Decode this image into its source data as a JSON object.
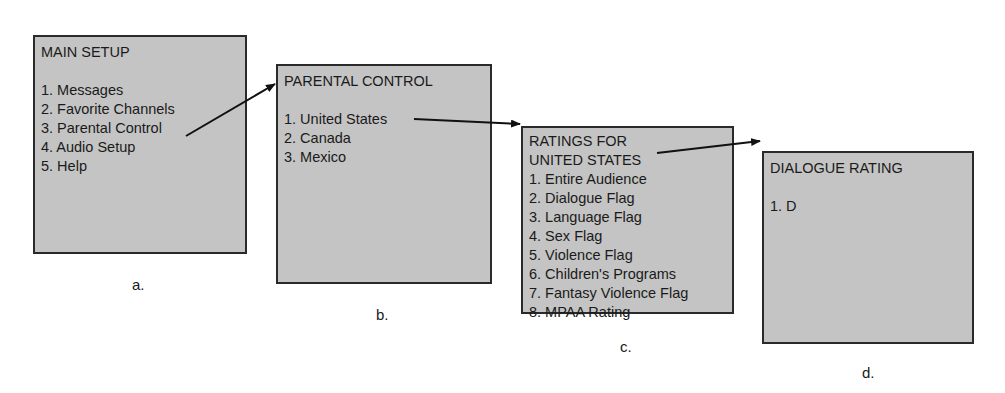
{
  "diagram": {
    "boxes": [
      {
        "id": "a",
        "title": "MAIN SETUP",
        "items": [
          "1. Messages",
          "2. Favorite Channels",
          "3. Parental Control",
          "4. Audio Setup",
          "5. Help"
        ],
        "caption": "a."
      },
      {
        "id": "b",
        "title": "PARENTAL CONTROL",
        "items": [
          "1. United States",
          "2. Canada",
          "3. Mexico"
        ],
        "caption": "b."
      },
      {
        "id": "c",
        "title": "RATINGS FOR\nUNITED STATES",
        "items": [
          "1. Entire Audience",
          "2. Dialogue Flag",
          "3. Language Flag",
          "4. Sex Flag",
          "5. Violence Flag",
          "6. Children's Programs",
          "7. Fantasy Violence Flag",
          "8. MPAA Rating"
        ],
        "caption": "c."
      },
      {
        "id": "d",
        "title": "DIALOGUE RATING",
        "items": [
          "1. D"
        ],
        "caption": "d."
      }
    ],
    "arrows": [
      {
        "from": "a: 3. Parental Control",
        "to": "b"
      },
      {
        "from": "b: 1. United States",
        "to": "c"
      },
      {
        "from": "c: 2. Dialogue Flag",
        "to": "d"
      }
    ],
    "colors": {
      "box_fill": "#c4c4c4",
      "box_border": "#2a2a2a",
      "arrow": "#111111",
      "background": "#ffffff"
    }
  }
}
